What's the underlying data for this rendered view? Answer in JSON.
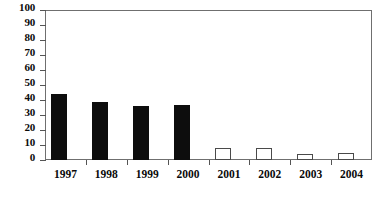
{
  "chart_data": {
    "type": "bar",
    "title": "",
    "subtitle": "",
    "xlabel": "",
    "ylabel": "",
    "categories": [
      "1997",
      "1998",
      "1999",
      "2000",
      "2001",
      "2002",
      "2003",
      "2004"
    ],
    "values": [
      44,
      39,
      36,
      37,
      8,
      8,
      4,
      5
    ],
    "series": [
      {
        "name": "",
        "values": [
          44,
          39,
          36,
          37,
          8,
          8,
          4,
          5
        ],
        "bar_styles": [
          "filled",
          "filled",
          "filled",
          "filled",
          "hollow",
          "hollow",
          "hollow",
          "hollow"
        ]
      }
    ],
    "ylim": [
      0,
      100
    ],
    "ytick_step": 10,
    "ytick_labels": [
      "0",
      "10",
      "20",
      "30",
      "40",
      "50",
      "60",
      "70",
      "80",
      "90",
      "100"
    ],
    "xtick_labels": [
      "1997",
      "1998",
      "1999",
      "2000",
      "2001",
      "2002",
      "2003",
      "2004"
    ],
    "grid": false,
    "legend": null,
    "legend_position": "none",
    "annotations": [],
    "colors": {
      "bar_filled": "#0d0d0d",
      "bar_hollow_fill": "#ffffff",
      "bar_hollow_stroke": "#4a4a4a",
      "axis": "#6f6f6f",
      "tick": "#555555",
      "text": "#0a0a0a",
      "background": "#ffffff"
    }
  }
}
